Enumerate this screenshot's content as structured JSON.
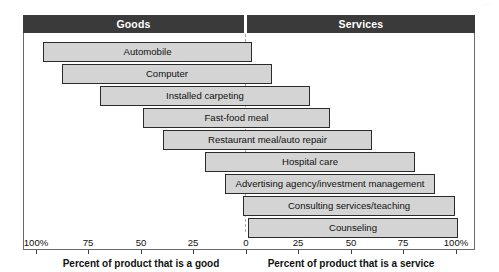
{
  "figure": {
    "page_artifact": "···",
    "header": {
      "left_label": "Goods",
      "right_label": "Services"
    },
    "axis_titles": {
      "left": "Percent of product that is a good",
      "right": "Percent of product that is a service"
    },
    "colors": {
      "header_band": "#3a3a3a",
      "header_text": "#ffffff",
      "bar_fill": "#d4d4d4",
      "bar_stroke": "#2b2b2b",
      "center_line": "#a9a9a9",
      "frame": "#6a6a6a",
      "text": "#111111"
    }
  },
  "chart_data": {
    "type": "bar",
    "orientation": "horizontal",
    "title": "",
    "subtitle": "",
    "xlabel_left": "Percent of product that is a good",
    "xlabel_right": "Percent of product that is a service",
    "ylabel": "",
    "grid": false,
    "legend": null,
    "axis_left_ticks": [
      "100%",
      "75",
      "50",
      "25",
      "0"
    ],
    "axis_right_ticks": [
      "0",
      "25",
      "50",
      "75",
      "100%"
    ],
    "xlim_goods": [
      100,
      0
    ],
    "xlim_services": [
      0,
      100
    ],
    "center_value": 0,
    "categories": [
      "Automobile",
      "Computer",
      "Installed carpeting",
      "Fast-food meal",
      "Restaurant meal/auto repair",
      "Hospital care",
      "Advertising agency/investment management",
      "Consulting services/teaching",
      "Counseling"
    ],
    "series": [
      {
        "name": "Percent good",
        "values": [
          97,
          88,
          70,
          49,
          40,
          20,
          10,
          0,
          0
        ]
      },
      {
        "name": "Percent service",
        "values": [
          3,
          12,
          30,
          40,
          60,
          80,
          90,
          100,
          100
        ]
      }
    ],
    "bars": [
      {
        "label": "Automobile",
        "good_start": 97,
        "service_end": 3,
        "left_px": 43,
        "width_px": 209,
        "top_px": 9
      },
      {
        "label": "Computer",
        "good_start": 88,
        "service_end": 12,
        "left_px": 62,
        "width_px": 210,
        "top_px": 31
      },
      {
        "label": "Installed carpeting",
        "good_start": 70,
        "service_end": 30,
        "left_px": 100,
        "width_px": 210,
        "top_px": 53
      },
      {
        "label": "Fast-food meal",
        "good_start": 49,
        "service_end": 40,
        "left_px": 143,
        "width_px": 187,
        "top_px": 75
      },
      {
        "label": "Restaurant meal/auto repair",
        "good_start": 40,
        "service_end": 60,
        "left_px": 163,
        "width_px": 209,
        "top_px": 97
      },
      {
        "label": "Hospital care",
        "good_start": 20,
        "service_end": 80,
        "left_px": 205,
        "width_px": 210,
        "top_px": 119
      },
      {
        "label": "Advertising agency/investment management",
        "good_start": 10,
        "service_end": 90,
        "left_px": 225,
        "width_px": 210,
        "top_px": 141
      },
      {
        "label": "Consulting services/teaching",
        "good_start": 1,
        "service_end": 99,
        "left_px": 243,
        "width_px": 212,
        "top_px": 163
      },
      {
        "label": "Counseling",
        "good_start": 0,
        "service_end": 100,
        "left_px": 248,
        "width_px": 210,
        "top_px": 185
      }
    ],
    "ticks_left_px": [
      36,
      88,
      141,
      193,
      246
    ],
    "ticks_right_px": [
      246,
      298,
      351,
      403,
      456
    ]
  }
}
